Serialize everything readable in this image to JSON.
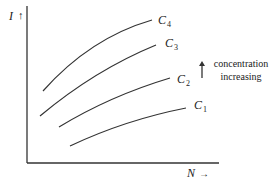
{
  "diagram": {
    "y_axis_label": "I",
    "y_axis_arrow": "↑",
    "x_axis_label": "N",
    "x_axis_arrow": "→",
    "annotation": {
      "arrow": "↑",
      "line1": "concentration",
      "line2": "increasing"
    },
    "curves": [
      {
        "name": "C",
        "sub": "4"
      },
      {
        "name": "C",
        "sub": "3"
      },
      {
        "name": "C",
        "sub": "2"
      },
      {
        "name": "C",
        "sub": "1"
      }
    ],
    "colors": {
      "line": "#333333",
      "background": "#ffffff"
    }
  }
}
